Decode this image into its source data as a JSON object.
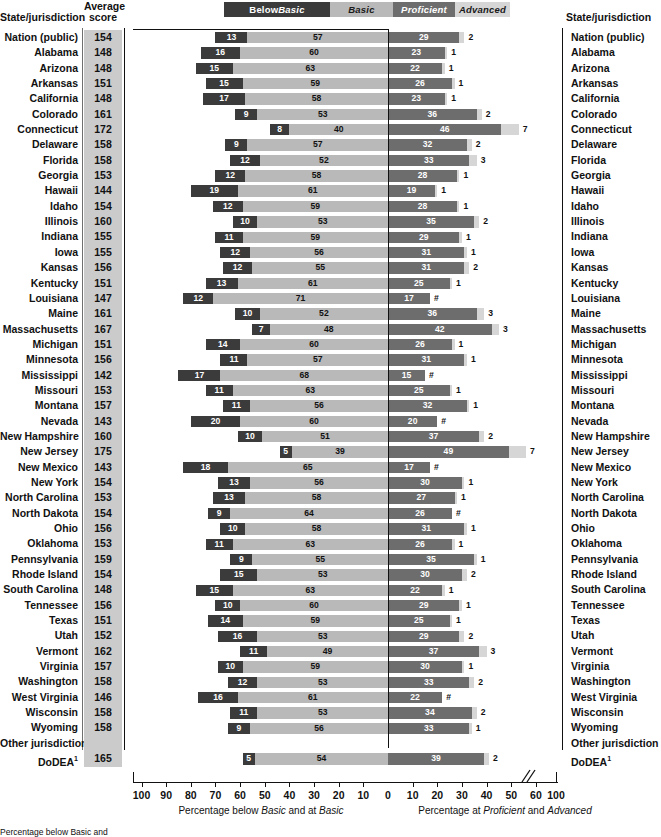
{
  "headers": {
    "state_left": "State/jurisdiction",
    "state_right": "State/jurisdiction",
    "avg_line1": "Average",
    "avg_line2": "score"
  },
  "legend": [
    {
      "key": "below",
      "label_plain": "Below ",
      "label_italic": "Basic",
      "color": "#3b3b3b"
    },
    {
      "key": "basic",
      "label_plain": "",
      "label_italic": "Basic",
      "color": "#b9b9b9"
    },
    {
      "key": "prof",
      "label_plain": "",
      "label_italic": "Proficient",
      "color": "#6d6d6d"
    },
    {
      "key": "adv",
      "label_plain": "",
      "label_italic": "Advanced",
      "color": "#d6d6d6"
    }
  ],
  "axis": {
    "left_ticks": [
      "100",
      "90",
      "80",
      "70",
      "60",
      "50",
      "40",
      "30",
      "20",
      "10",
      "0"
    ],
    "right_ticks": [
      "0",
      "10",
      "20",
      "30",
      "40",
      "50",
      "60",
      "100"
    ],
    "caption_left_pre": "Percentage below ",
    "caption_left_it1": "Basic",
    "caption_left_mid": " and at ",
    "caption_left_it2": "Basic",
    "caption_right_pre": "Percentage at ",
    "caption_right_it1": "Proficient",
    "caption_right_mid": " and ",
    "caption_right_it2": "Advanced",
    "break_symbol": "//"
  },
  "footnote": "Percentage below Basic and",
  "chart_data": {
    "type": "bar",
    "title": "",
    "subtype": "diverging-stacked-bar",
    "categories_label": "State/jurisdiction",
    "series": [
      {
        "name": "Below Basic",
        "color": "#3b3b3b",
        "side": "left"
      },
      {
        "name": "Basic",
        "color": "#b9b9b9",
        "side": "left"
      },
      {
        "name": "Proficient",
        "color": "#6d6d6d",
        "side": "right"
      },
      {
        "name": "Advanced",
        "color": "#d6d6d6",
        "side": "right"
      }
    ],
    "xlabel_left": "Percentage below Basic and at Basic",
    "xlabel_right": "Percentage at Proficient and Advanced",
    "xlim_left": [
      0,
      100
    ],
    "xlim_right": [
      0,
      100
    ],
    "grid": false,
    "legend_position": "top",
    "rows": [
      {
        "name": "Nation (public)",
        "score": "154",
        "below": 13,
        "basic": 57,
        "prof": 29,
        "adv": 2,
        "adv_label": "2"
      },
      {
        "name": "Alabama",
        "score": "148",
        "below": 16,
        "basic": 60,
        "prof": 23,
        "adv": 1,
        "adv_label": "1"
      },
      {
        "name": "Arizona",
        "score": "148",
        "below": 15,
        "basic": 63,
        "prof": 22,
        "adv": 1,
        "adv_label": "1"
      },
      {
        "name": "Arkansas",
        "score": "151",
        "below": 15,
        "basic": 59,
        "prof": 26,
        "adv": 1,
        "adv_label": "1"
      },
      {
        "name": "California",
        "score": "148",
        "below": 17,
        "basic": 58,
        "prof": 23,
        "adv": 1,
        "adv_label": "1"
      },
      {
        "name": "Colorado",
        "score": "161",
        "below": 9,
        "basic": 53,
        "prof": 36,
        "adv": 2,
        "adv_label": "2"
      },
      {
        "name": "Connecticut",
        "score": "172",
        "below": 8,
        "basic": 40,
        "prof": 46,
        "adv": 7,
        "adv_label": "7"
      },
      {
        "name": "Delaware",
        "score": "158",
        "below": 9,
        "basic": 57,
        "prof": 32,
        "adv": 2,
        "adv_label": "2"
      },
      {
        "name": "Florida",
        "score": "158",
        "below": 12,
        "basic": 52,
        "prof": 33,
        "adv": 3,
        "adv_label": "3"
      },
      {
        "name": "Georgia",
        "score": "153",
        "below": 12,
        "basic": 58,
        "prof": 28,
        "adv": 1,
        "adv_label": "1"
      },
      {
        "name": "Hawaii",
        "score": "144",
        "below": 19,
        "basic": 61,
        "prof": 19,
        "adv": 1,
        "adv_label": "1"
      },
      {
        "name": "Idaho",
        "score": "154",
        "below": 12,
        "basic": 59,
        "prof": 28,
        "adv": 1,
        "adv_label": "1"
      },
      {
        "name": "Illinois",
        "score": "160",
        "below": 10,
        "basic": 53,
        "prof": 35,
        "adv": 2,
        "adv_label": "2"
      },
      {
        "name": "Indiana",
        "score": "155",
        "below": 11,
        "basic": 59,
        "prof": 29,
        "adv": 1,
        "adv_label": "1"
      },
      {
        "name": "Iowa",
        "score": "155",
        "below": 12,
        "basic": 56,
        "prof": 31,
        "adv": 1,
        "adv_label": "1"
      },
      {
        "name": "Kansas",
        "score": "156",
        "below": 12,
        "basic": 55,
        "prof": 31,
        "adv": 2,
        "adv_label": "2"
      },
      {
        "name": "Kentucky",
        "score": "151",
        "below": 13,
        "basic": 61,
        "prof": 25,
        "adv": 1,
        "adv_label": "1"
      },
      {
        "name": "Louisiana",
        "score": "147",
        "below": 12,
        "basic": 71,
        "prof": 17,
        "adv": 0,
        "adv_label": "#"
      },
      {
        "name": "Maine",
        "score": "161",
        "below": 10,
        "basic": 52,
        "prof": 36,
        "adv": 3,
        "adv_label": "3"
      },
      {
        "name": "Massachusetts",
        "score": "167",
        "below": 7,
        "basic": 48,
        "prof": 42,
        "adv": 3,
        "adv_label": "3"
      },
      {
        "name": "Michigan",
        "score": "151",
        "below": 14,
        "basic": 60,
        "prof": 26,
        "adv": 1,
        "adv_label": "1"
      },
      {
        "name": "Minnesota",
        "score": "156",
        "below": 11,
        "basic": 57,
        "prof": 31,
        "adv": 1,
        "adv_label": "1"
      },
      {
        "name": "Mississippi",
        "score": "142",
        "below": 17,
        "basic": 68,
        "prof": 15,
        "adv": 0,
        "adv_label": "#"
      },
      {
        "name": "Missouri",
        "score": "153",
        "below": 11,
        "basic": 63,
        "prof": 25,
        "adv": 1,
        "adv_label": "1"
      },
      {
        "name": "Montana",
        "score": "157",
        "below": 11,
        "basic": 56,
        "prof": 32,
        "adv": 1,
        "adv_label": "1"
      },
      {
        "name": "Nevada",
        "score": "143",
        "below": 20,
        "basic": 60,
        "prof": 20,
        "adv": 0,
        "adv_label": "#"
      },
      {
        "name": "New Hampshire",
        "score": "160",
        "below": 10,
        "basic": 51,
        "prof": 37,
        "adv": 2,
        "adv_label": "2"
      },
      {
        "name": "New Jersey",
        "score": "175",
        "below": 5,
        "basic": 39,
        "prof": 49,
        "adv": 7,
        "adv_label": "7"
      },
      {
        "name": "New Mexico",
        "score": "143",
        "below": 18,
        "basic": 65,
        "prof": 17,
        "adv": 0,
        "adv_label": "#"
      },
      {
        "name": "New York",
        "score": "154",
        "below": 13,
        "basic": 56,
        "prof": 30,
        "adv": 1,
        "adv_label": "1"
      },
      {
        "name": "North Carolina",
        "score": "153",
        "below": 13,
        "basic": 58,
        "prof": 27,
        "adv": 1,
        "adv_label": "1"
      },
      {
        "name": "North Dakota",
        "score": "154",
        "below": 9,
        "basic": 64,
        "prof": 26,
        "adv": 0,
        "adv_label": "#"
      },
      {
        "name": "Ohio",
        "score": "156",
        "below": 10,
        "basic": 58,
        "prof": 31,
        "adv": 1,
        "adv_label": "1"
      },
      {
        "name": "Oklahoma",
        "score": "153",
        "below": 11,
        "basic": 63,
        "prof": 26,
        "adv": 1,
        "adv_label": "1"
      },
      {
        "name": "Pennsylvania",
        "score": "159",
        "below": 9,
        "basic": 55,
        "prof": 35,
        "adv": 1,
        "adv_label": "1"
      },
      {
        "name": "Rhode Island",
        "score": "154",
        "below": 15,
        "basic": 53,
        "prof": 30,
        "adv": 2,
        "adv_label": "2"
      },
      {
        "name": "South Carolina",
        "score": "148",
        "below": 15,
        "basic": 63,
        "prof": 22,
        "adv": 1,
        "adv_label": "1"
      },
      {
        "name": "Tennessee",
        "score": "156",
        "below": 10,
        "basic": 60,
        "prof": 29,
        "adv": 1,
        "adv_label": "1"
      },
      {
        "name": "Texas",
        "score": "151",
        "below": 14,
        "basic": 59,
        "prof": 25,
        "adv": 1,
        "adv_label": "1"
      },
      {
        "name": "Utah",
        "score": "152",
        "below": 16,
        "basic": 53,
        "prof": 29,
        "adv": 2,
        "adv_label": "2"
      },
      {
        "name": "Vermont",
        "score": "162",
        "below": 11,
        "basic": 49,
        "prof": 37,
        "adv": 3,
        "adv_label": "3"
      },
      {
        "name": "Virginia",
        "score": "157",
        "below": 10,
        "basic": 59,
        "prof": 30,
        "adv": 1,
        "adv_label": "1"
      },
      {
        "name": "Washington",
        "score": "158",
        "below": 12,
        "basic": 53,
        "prof": 33,
        "adv": 2,
        "adv_label": "2"
      },
      {
        "name": "West Virginia",
        "score": "146",
        "below": 16,
        "basic": 61,
        "prof": 22,
        "adv": 0,
        "adv_label": "#"
      },
      {
        "name": "Wisconsin",
        "score": "158",
        "below": 11,
        "basic": 53,
        "prof": 34,
        "adv": 2,
        "adv_label": "2"
      },
      {
        "name": "Wyoming",
        "score": "158",
        "below": 9,
        "basic": 56,
        "prof": 33,
        "adv": 1,
        "adv_label": "1"
      },
      {
        "name": "Other jurisdiction",
        "score": "",
        "group": true
      },
      {
        "name": "DoDEA",
        "sup": "1",
        "score": "165",
        "below": 5,
        "basic": 54,
        "prof": 39,
        "adv": 2,
        "adv_label": "2"
      }
    ]
  }
}
